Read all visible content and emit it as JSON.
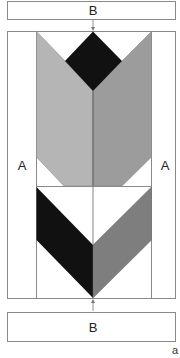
{
  "diagram": {
    "labels": {
      "top_box": "B",
      "bottom_box": "B",
      "left_column": "A",
      "right_column": "A",
      "figure_tag": "a"
    },
    "colors": {
      "outline": "#8a8a8a",
      "black": "#111111",
      "light_gray": "#b5b5b5",
      "mid_gray": "#9c9c9c",
      "dark_gray": "#7e7e7e",
      "white": "#ffffff",
      "arrow": "#777777"
    }
  }
}
